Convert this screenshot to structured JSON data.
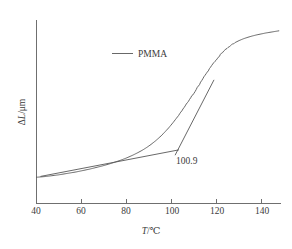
{
  "chart_data": {
    "type": "line",
    "title": "",
    "xlabel": "T/℃",
    "ylabel": "ΔL/μm",
    "xlabel_italic_part": "T",
    "xlabel_rest": "/℃",
    "ylabel_italic_part": "L",
    "ylabel_prefix": "Δ",
    "ylabel_suffix": "/μm",
    "xlim": [
      40,
      151
    ],
    "ylim": [
      0,
      1
    ],
    "xticks": [
      40,
      60,
      80,
      100,
      120,
      140
    ],
    "xticklabels": [
      "40",
      "60",
      "80",
      "100",
      "120",
      "140"
    ],
    "yticks": [],
    "yticklabels": [],
    "grid": false,
    "legend_position": "upper-center-left",
    "legend": [
      {
        "name": "PMMA",
        "color": "#575757"
      }
    ],
    "annotations": [
      {
        "text": "100.9",
        "x": 103.5,
        "y": 0.215,
        "describes": "glass-transition-onset-temperature"
      }
    ],
    "series": [
      {
        "name": "PMMA",
        "color": "#575757",
        "x": [
          40,
          42,
          44,
          46,
          48,
          50,
          52,
          54,
          56,
          58,
          60,
          62,
          64,
          66,
          68,
          70,
          72,
          74,
          76,
          78,
          80,
          82,
          84,
          86,
          88,
          90,
          92,
          94,
          96,
          98,
          100,
          102,
          104,
          106,
          108,
          110,
          112,
          114,
          116,
          118,
          120,
          122,
          124,
          126,
          128,
          130,
          132,
          134,
          136,
          138,
          140,
          142,
          144,
          146,
          148,
          150
        ],
        "y": [
          0.143,
          0.145,
          0.147,
          0.15,
          0.153,
          0.156,
          0.16,
          0.164,
          0.168,
          0.172,
          0.177,
          0.182,
          0.187,
          0.193,
          0.199,
          0.205,
          0.212,
          0.219,
          0.227,
          0.235,
          0.244,
          0.254,
          0.265,
          0.277,
          0.29,
          0.305,
          0.322,
          0.341,
          0.362,
          0.386,
          0.412,
          0.441,
          0.472,
          0.505,
          0.54,
          0.577,
          0.615,
          0.653,
          0.69,
          0.726,
          0.76,
          0.791,
          0.818,
          0.841,
          0.86,
          0.876,
          0.888,
          0.898,
          0.906,
          0.913,
          0.919,
          0.924,
          0.929,
          0.933,
          0.937,
          0.941
        ]
      }
    ],
    "tangents": [
      {
        "name": "baseline-tangent",
        "x": [
          42.0,
          104.5
        ],
        "y": [
          0.148,
          0.292
        ]
      },
      {
        "name": "transition-tangent",
        "x": [
          103.0,
          120.5
        ],
        "y": [
          0.265,
          0.672
        ]
      }
    ]
  }
}
